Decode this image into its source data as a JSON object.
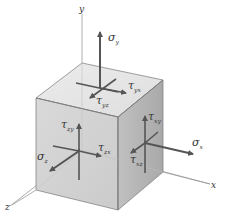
{
  "figure": {
    "colors": {
      "top_face": "#e4e4e4",
      "front_face": "#d2d2d2",
      "right_face": "#b4b4b4",
      "edge": "#777777",
      "arrow": "#555555",
      "axis": "#999999",
      "text": "#333333"
    }
  },
  "axes": {
    "x": {
      "label": "x"
    },
    "y": {
      "label": "y"
    },
    "z": {
      "label": "z"
    }
  },
  "stresses": {
    "sigma_y": {
      "symbol": "σ",
      "subscript": "y"
    },
    "tau_yx": {
      "symbol": "τ",
      "subscript": "yx"
    },
    "tau_yz": {
      "symbol": "τ",
      "subscript": "yz"
    },
    "tau_zy": {
      "symbol": "τ",
      "subscript": "zy"
    },
    "tau_zx": {
      "symbol": "τ",
      "subscript": "zx"
    },
    "sigma_z": {
      "symbol": "σ",
      "subscript": "z"
    },
    "tau_xy": {
      "symbol": "τ",
      "subscript": "xy"
    },
    "tau_xz": {
      "symbol": "τ",
      "subscript": "xz"
    },
    "sigma_x": {
      "symbol": "σ",
      "subscript": "x"
    }
  }
}
